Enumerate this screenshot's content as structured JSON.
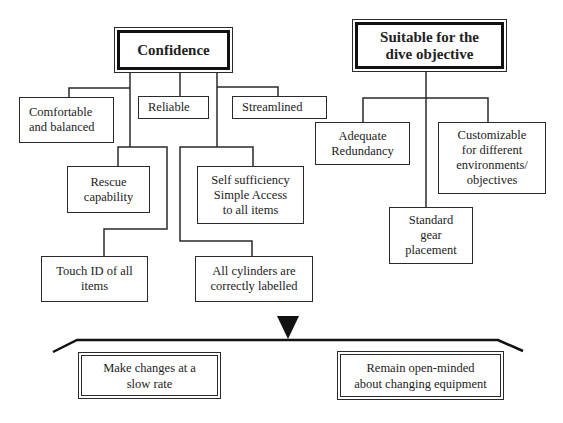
{
  "diagram": {
    "type": "hierarchy",
    "colors": {
      "line": "#2a2a2a",
      "background": "#ffffff"
    },
    "confidence": {
      "title": "Confidence",
      "children": [
        {
          "id": "comfortable",
          "label": "Comfortable\nand balanced"
        },
        {
          "id": "reliable",
          "label": "Reliable"
        },
        {
          "id": "streamlined",
          "label": "Streamlined"
        },
        {
          "id": "rescue",
          "label": "Rescue\ncapability"
        },
        {
          "id": "self-sufficiency",
          "label": "Self sufficiency\nSimple Access\nto all items"
        },
        {
          "id": "touch-id",
          "label": "Touch ID of all\nitems"
        },
        {
          "id": "cylinders",
          "label": "All cylinders are\ncorrectly labelled"
        }
      ]
    },
    "suitable": {
      "title": "Suitable for the\ndive objective",
      "children": [
        {
          "id": "redundancy",
          "label": "Adequate\nRedundancy"
        },
        {
          "id": "customizable",
          "label": "Customizable\nfor different\nenvironments/\nobjectives"
        },
        {
          "id": "standard",
          "label": "Standard\ngear\nplacement"
        }
      ]
    },
    "balance": {
      "pointer_icon": "down-triangle",
      "left": "Make changes at a\nslow rate",
      "right": "Remain open-minded\nabout changing equipment"
    }
  }
}
